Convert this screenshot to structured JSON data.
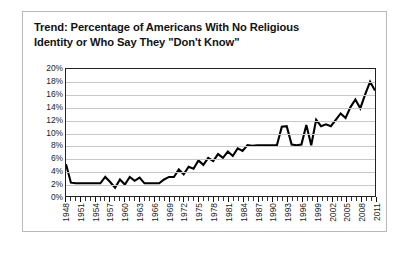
{
  "chart_data": {
    "type": "line",
    "title": "Trend: Percentage of Americans With No Religious Identity or Who Say They \"Don't Know\"",
    "title_line1": "Trend: Percentage of Americans With No Religious",
    "title_line2": "Identity or Who Say They \"Don't Know\"",
    "xlabel": "",
    "ylabel": "",
    "ylim": [
      0,
      20
    ],
    "xlim": [
      1948,
      2011
    ],
    "grid": true,
    "legend": false,
    "line_color": "#000000",
    "y_ticks": [
      0,
      2,
      4,
      6,
      8,
      10,
      12,
      14,
      16,
      18,
      20
    ],
    "y_tick_labels": [
      "0%",
      "2%",
      "4%",
      "6%",
      "8%",
      "10%",
      "12%",
      "14%",
      "16%",
      "18%",
      "20%"
    ],
    "x_tick_labels": [
      "1948",
      "1951",
      "1954",
      "1957",
      "1960",
      "1963",
      "1966",
      "1969",
      "1972",
      "1975",
      "1978",
      "1981",
      "1984",
      "1987",
      "1990",
      "1993",
      "1996",
      "1999",
      "2002",
      "2005",
      "2008",
      "2011"
    ],
    "x": [
      1948,
      1949,
      1950,
      1951,
      1952,
      1953,
      1954,
      1955,
      1956,
      1957,
      1958,
      1959,
      1960,
      1961,
      1962,
      1963,
      1964,
      1965,
      1966,
      1967,
      1968,
      1969,
      1970,
      1971,
      1972,
      1973,
      1974,
      1975,
      1976,
      1977,
      1978,
      1979,
      1980,
      1981,
      1982,
      1983,
      1984,
      1985,
      1986,
      1987,
      1988,
      1989,
      1990,
      1991,
      1992,
      1993,
      1994,
      1995,
      1996,
      1997,
      1998,
      1999,
      2000,
      2001,
      2002,
      2003,
      2004,
      2005,
      2006,
      2007,
      2008,
      2009,
      2010,
      2011
    ],
    "values": [
      5.0,
      2.1,
      2.0,
      2.0,
      2.0,
      2.0,
      2.0,
      2.0,
      3.0,
      2.2,
      1.3,
      2.6,
      1.8,
      3.0,
      2.4,
      2.9,
      2.0,
      2.0,
      2.0,
      2.0,
      2.6,
      3.0,
      3.0,
      4.2,
      3.4,
      4.6,
      4.3,
      5.6,
      4.9,
      6.0,
      5.5,
      6.6,
      6.0,
      7.0,
      6.3,
      7.5,
      7.1,
      8.0,
      7.9,
      8.0,
      8.0,
      8.0,
      8.0,
      8.0,
      10.9,
      11.0,
      8.1,
      8.0,
      8.1,
      11.2,
      8.0,
      12.0,
      11.0,
      11.3,
      11.0,
      12.0,
      13.0,
      12.3,
      14.0,
      15.2,
      13.8,
      16.0,
      18.0,
      16.6
    ]
  }
}
